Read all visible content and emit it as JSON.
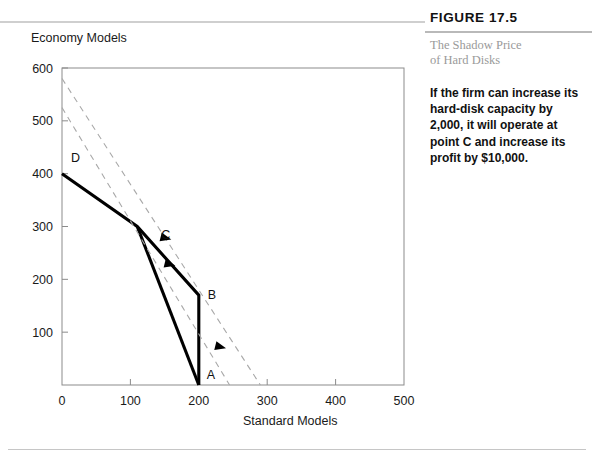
{
  "figure": {
    "number_label": "FIGURE 17.5",
    "subtitle_line1": "The Shadow Price",
    "subtitle_line2": "of Hard Disks",
    "caption": "If the firm can increase its hard-disk capacity by 2,000, it will operate at point C and increase its profit by $10,000."
  },
  "chart_data": {
    "type": "line",
    "title": "",
    "xlabel": "Standard Models",
    "ylabel": "Economy Models",
    "xlim": [
      0,
      500
    ],
    "ylim": [
      0,
      600
    ],
    "xticks": [
      0,
      100,
      200,
      300,
      400,
      500
    ],
    "yticks": [
      100,
      200,
      300,
      400,
      500,
      600
    ],
    "xticklabels": [
      "0",
      "100",
      "200",
      "300",
      "400",
      "500"
    ],
    "yticklabels": [
      "100",
      "200",
      "300",
      "400",
      "500",
      "600"
    ],
    "grid": false,
    "legend": "none",
    "series": [
      {
        "name": "feasible-frontier-original",
        "style": "solid-thick",
        "color": "#000000",
        "points": [
          [
            0,
            400
          ],
          [
            110,
            300
          ],
          [
            200,
            170
          ],
          [
            200,
            0
          ]
        ]
      },
      {
        "name": "feasible-frontier-expanded",
        "style": "solid-thick",
        "color": "#000000",
        "points": [
          [
            110,
            300
          ],
          [
            200,
            0
          ]
        ]
      },
      {
        "name": "isoprofit-higher",
        "style": "dashed",
        "color": "#a8a8a8",
        "points": [
          [
            0,
            580
          ],
          [
            290,
            0
          ]
        ]
      },
      {
        "name": "isoprofit-lower",
        "style": "dashed",
        "color": "#a8a8a8",
        "points": [
          [
            0,
            525
          ],
          [
            245,
            0
          ]
        ]
      }
    ],
    "annotations": [
      {
        "label": "A",
        "x": 200,
        "y": 0,
        "dx": 8,
        "dy": -6
      },
      {
        "label": "B",
        "x": 200,
        "y": 170,
        "dx": 9,
        "dy": 4
      },
      {
        "label": "C",
        "x": 132,
        "y": 283,
        "dx": 9,
        "dy": 4
      },
      {
        "label": "D",
        "x": 0,
        "y": 400,
        "dx": 9,
        "dy": -12
      }
    ],
    "arrow_markers": [
      {
        "on": "isoprofit-higher",
        "x": 152,
        "y": 278,
        "direction": "down-right"
      },
      {
        "on": "isoprofit-lower",
        "x": 232,
        "y": 72,
        "direction": "down-right"
      },
      {
        "on": "frontier-expanded",
        "x": 158,
        "y": 228,
        "direction": "down-right"
      }
    ]
  }
}
